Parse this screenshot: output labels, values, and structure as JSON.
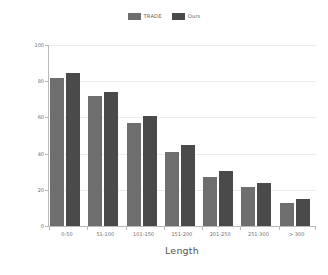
{
  "chart_data": {
    "type": "bar",
    "title": "",
    "subtitle": "",
    "xlabel": "Length",
    "ylabel": "Joint Accuracy",
    "categories": [
      "0-50",
      "51-100",
      "101-150",
      "151-200",
      "201-250",
      "251-300",
      "> 300"
    ],
    "series": [
      {
        "name": "TRADE",
        "color": "#6e6e6e",
        "values": [
          82,
          72,
          57,
          41,
          27,
          21.5,
          12.5
        ]
      },
      {
        "name": "Ours",
        "color": "#4a4a4a",
        "values": [
          84.5,
          74,
          61,
          45,
          30.5,
          23.5,
          15
        ]
      }
    ],
    "ylim": [
      0,
      100
    ],
    "yticks": [
      0,
      20,
      40,
      60,
      80,
      100
    ],
    "ytick_labels": [
      "0",
      "20",
      "40",
      "60",
      "80",
      "100"
    ],
    "grid": "horizontal",
    "legend_position": "top-center",
    "grid_color": "#ececec",
    "axis_color": "#b9b9b9",
    "tick_label_color": "#6d6d6d",
    "axis_title_color": "#555555",
    "background_color": "#ffffff"
  }
}
